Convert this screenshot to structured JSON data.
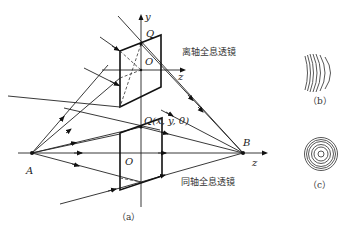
{
  "figure": {
    "labels": {
      "y_axis": "y",
      "z_axis_upper": "z",
      "z_axis_main": "z",
      "point_Q_top": "Q",
      "origin_upper": "O",
      "origin_lower": "O",
      "point_Q_xy": "Q(x, y, 0)",
      "point_A": "A",
      "point_B": "B"
    },
    "annotations": {
      "off_axis_lens": "离轴全息透镜",
      "on_axis_lens": "同轴全息透镜"
    },
    "captions": {
      "a": "（a）",
      "b": "（b）",
      "c": "（c）"
    }
  }
}
